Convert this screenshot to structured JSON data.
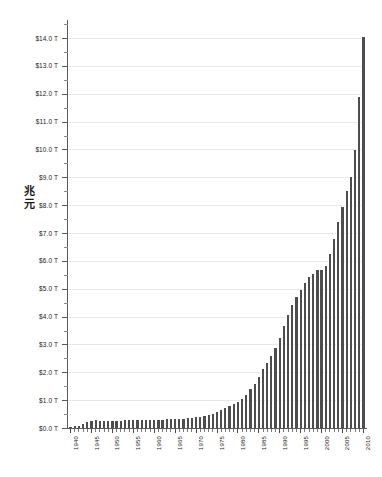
{
  "chart_data": {
    "type": "bar",
    "title": "",
    "subtitle": "",
    "xlabel": "",
    "ylabel": "兆元",
    "ylabel_chars": [
      "兆",
      "元"
    ],
    "xlim": [
      1940,
      2010
    ],
    "ylim": [
      0,
      14
    ],
    "y_tick_step": 1.0,
    "y_minor_step": 0.5,
    "y_tick_labels": [
      "$0.0 T",
      "$1.0 T",
      "$2.0 T",
      "$3.0 T",
      "$4.0 T",
      "$5.0 T",
      "$6.0 T",
      "$7.0 T",
      "$8.0 T",
      "$9.0 T",
      "$10.0 T",
      "$11.0 T",
      "$12.0 T",
      "$13.0 T",
      "$14.0 T"
    ],
    "y_tick_values": [
      0,
      1,
      2,
      3,
      4,
      5,
      6,
      7,
      8,
      9,
      10,
      11,
      12,
      13,
      14
    ],
    "x_tick_labels": [
      "1940",
      "1945",
      "1950",
      "1955",
      "1960",
      "1965",
      "1970",
      "1975",
      "1980",
      "1985",
      "1990",
      "1995",
      "2000",
      "2005",
      "2010"
    ],
    "x_tick_values": [
      1940,
      1945,
      1950,
      1955,
      1960,
      1965,
      1970,
      1975,
      1980,
      1985,
      1990,
      1995,
      2000,
      2005,
      2010
    ],
    "grid": true,
    "grid_axis": "y",
    "legend": false,
    "legend_position": "none",
    "bar_color": "#4d4d4d",
    "grid_color": "#e8e8e8",
    "axis_color": "#5a5a5a",
    "unit": "trillion",
    "categories": [
      1940,
      1941,
      1942,
      1943,
      1944,
      1945,
      1946,
      1947,
      1948,
      1949,
      1950,
      1951,
      1952,
      1953,
      1954,
      1955,
      1956,
      1957,
      1958,
      1959,
      1960,
      1961,
      1962,
      1963,
      1964,
      1965,
      1966,
      1967,
      1968,
      1969,
      1970,
      1971,
      1972,
      1973,
      1974,
      1975,
      1976,
      1977,
      1978,
      1979,
      1980,
      1981,
      1982,
      1983,
      1984,
      1985,
      1986,
      1987,
      1988,
      1989,
      1990,
      1991,
      1992,
      1993,
      1994,
      1995,
      1996,
      1997,
      1998,
      1999,
      2000,
      2001,
      2002,
      2003,
      2004,
      2005,
      2006,
      2007,
      2008,
      2009,
      2010
    ],
    "values": [
      0.05,
      0.06,
      0.08,
      0.14,
      0.2,
      0.26,
      0.27,
      0.26,
      0.25,
      0.25,
      0.26,
      0.26,
      0.26,
      0.27,
      0.27,
      0.27,
      0.27,
      0.27,
      0.28,
      0.29,
      0.29,
      0.29,
      0.3,
      0.31,
      0.32,
      0.32,
      0.33,
      0.34,
      0.36,
      0.37,
      0.38,
      0.41,
      0.44,
      0.47,
      0.49,
      0.58,
      0.65,
      0.72,
      0.79,
      0.85,
      0.93,
      1.03,
      1.2,
      1.41,
      1.58,
      1.82,
      2.12,
      2.35,
      2.6,
      2.87,
      3.23,
      3.67,
      4.06,
      4.41,
      4.69,
      4.97,
      5.22,
      5.41,
      5.53,
      5.66,
      5.67,
      5.81,
      6.23,
      6.78,
      7.38,
      7.93,
      8.51,
      9.01,
      9.99,
      11.9,
      14.03
    ],
    "series_name": "Total public debt"
  }
}
